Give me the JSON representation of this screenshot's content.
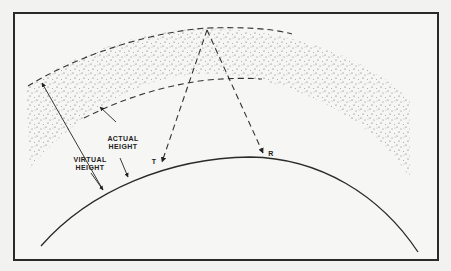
{
  "diagram": {
    "type": "ionospheric reflection geometry",
    "labels": {
      "virtual_height_line1": "VIRTUAL",
      "virtual_height_line2": "HEIGHT",
      "actual_height_line1": "ACTUAL",
      "actual_height_line2": "HEIGHT",
      "transmitter": "T",
      "receiver": "R"
    },
    "elements": [
      "earth-surface-arc",
      "ionosphere-layer-stippled",
      "virtual-reflection-height-dashed-curve",
      "actual-height-dashed-curve",
      "transmitted-ray-dashed",
      "received-ray-dashed",
      "virtual-height-arrow",
      "actual-height-arrow"
    ],
    "colors": {
      "line": "#2a2a2a",
      "stipple": "#555555",
      "background": "#f6f6f4"
    }
  }
}
